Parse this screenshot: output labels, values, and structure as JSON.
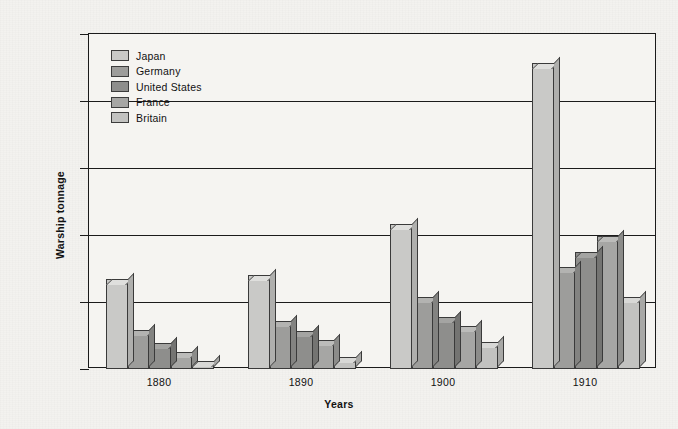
{
  "chart_data": {
    "type": "bar",
    "title": "",
    "xlabel": "Years",
    "ylabel": "Warship tonnage",
    "categories": [
      "1880",
      "1890",
      "1900",
      "1910"
    ],
    "ylim": [
      0,
      2500000
    ],
    "ytick_values": [
      0,
      500000,
      1000000,
      1500000,
      2000000,
      2500000
    ],
    "ytick_labels": [
      "0",
      "500,000",
      "1,000,000",
      "1,500,000",
      "2,000,000",
      "2,500,000"
    ],
    "grid": true,
    "legend_position": "upper-left-inside",
    "series": [
      {
        "name": "Japan",
        "color": "#c9c9c7",
        "values": [
          670000,
          700000,
          1080000,
          2280000
        ]
      },
      {
        "name": "Germany",
        "color": "#9d9d9b",
        "values": [
          290000,
          360000,
          540000,
          760000
        ]
      },
      {
        "name": "United States",
        "color": "#8e8e8c",
        "values": [
          195000,
          280000,
          390000,
          870000
        ]
      },
      {
        "name": "France",
        "color": "#a6a6a4",
        "values": [
          130000,
          215000,
          320000,
          990000
        ]
      },
      {
        "name": "Britain",
        "color": "#c2c2c0",
        "values": [
          60000,
          90000,
          205000,
          540000
        ]
      }
    ]
  }
}
